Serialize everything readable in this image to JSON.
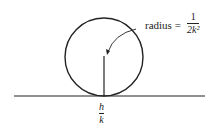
{
  "diagram": {
    "radius_label": {
      "text": "radius =",
      "numerator": "1",
      "denominator": "2k²"
    },
    "tangent_point_label": {
      "numerator": "h",
      "denominator": "k"
    },
    "colors": {
      "stroke": "#222222",
      "background": "#ffffff"
    }
  }
}
